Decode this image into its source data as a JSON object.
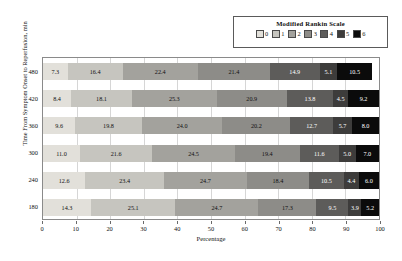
{
  "chart_data": {
    "type": "bar",
    "orientation": "horizontal",
    "stacked": true,
    "stack_mode": "percent",
    "title": "",
    "xlabel": "Percentage",
    "ylabel": "Time From Symptom Onset to Reperfusion, min",
    "xlim": [
      0,
      100
    ],
    "xticks": [
      0,
      10,
      20,
      30,
      40,
      50,
      60,
      70,
      80,
      90,
      100
    ],
    "grid": true,
    "grid_axis": "x",
    "legend_title": "Modified Rankin Scale",
    "legend_position": "top-right",
    "legend_entries": [
      "0",
      "1",
      "2",
      "3",
      "4",
      "5",
      "6"
    ],
    "categories": [
      "480",
      "420",
      "360",
      "300",
      "240",
      "180"
    ],
    "series": [
      {
        "name": "0",
        "color": "#e2e0da",
        "values": [
          7.3,
          8.4,
          9.6,
          11.0,
          12.6,
          14.3
        ]
      },
      {
        "name": "1",
        "color": "#c6c5bf",
        "values": [
          16.4,
          18.1,
          19.8,
          21.6,
          23.4,
          25.1
        ]
      },
      {
        "name": "2",
        "color": "#a3a29d",
        "values": [
          22.4,
          25.3,
          24.0,
          24.5,
          24.7,
          24.7
        ]
      },
      {
        "name": "3",
        "color": "#8d8c88",
        "values": [
          21.4,
          20.9,
          20.2,
          19.4,
          18.4,
          17.3
        ]
      },
      {
        "name": "4",
        "color": "#5d5c5a",
        "values": [
          14.9,
          13.8,
          12.7,
          11.6,
          10.5,
          9.5
        ]
      },
      {
        "name": "5",
        "color": "#3d3c3b",
        "values": [
          5.1,
          4.5,
          5.7,
          5.0,
          4.4,
          3.9
        ]
      },
      {
        "name": "6",
        "color": "#0b0b0b",
        "values": [
          10.5,
          9.2,
          8.0,
          7.0,
          6.0,
          5.2
        ]
      }
    ],
    "label_colors": [
      "#111111",
      "#111111",
      "#111111",
      "#111111",
      "#ffffff",
      "#ffffff",
      "#ffffff"
    ],
    "rows": [
      {
        "category": "480",
        "values": [
          7.3,
          16.4,
          22.4,
          21.4,
          14.9,
          5.1,
          10.5
        ]
      },
      {
        "category": "420",
        "values": [
          8.4,
          18.1,
          25.3,
          20.9,
          13.8,
          4.5,
          9.2
        ]
      },
      {
        "category": "360",
        "values": [
          9.6,
          19.8,
          24.0,
          20.2,
          12.7,
          5.7,
          8.0
        ]
      },
      {
        "category": "300",
        "values": [
          11.0,
          21.6,
          24.5,
          19.4,
          11.6,
          5.0,
          7.0
        ]
      },
      {
        "category": "240",
        "values": [
          12.6,
          23.4,
          24.7,
          18.4,
          10.5,
          4.4,
          6.0
        ]
      },
      {
        "category": "180",
        "values": [
          14.3,
          25.1,
          24.7,
          17.3,
          9.5,
          3.9,
          5.2
        ]
      }
    ]
  },
  "colors": {
    "plot_border": "#8a8a8a",
    "gridline": "#d6d6d6",
    "legend_border": "#5a5a5a",
    "background": "#ffffff",
    "text": "#111111"
  }
}
